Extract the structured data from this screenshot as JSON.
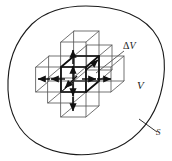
{
  "figure": {
    "labels": {
      "delta_volume": "ΔV",
      "delta_symbol": "Δ",
      "volume_symbol": "V",
      "volume": "V",
      "surface": "S"
    },
    "colors": {
      "outline": "#1a1a1a",
      "cube_line": "#4d4d4d",
      "cube_bold": "#111111",
      "arrow": "#111111",
      "background": "#ffffff"
    },
    "elements": {
      "enclosing_surface": "closed-blob-outline",
      "central_cell": "bold-cube",
      "neighbor_cells": 6,
      "flux_arrows": 12,
      "leader_lines": 2
    }
  }
}
